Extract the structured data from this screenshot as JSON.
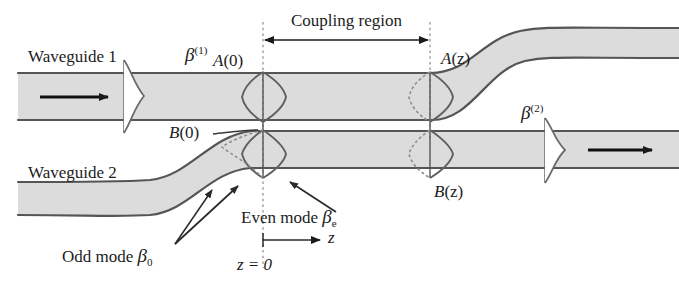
{
  "figure": {
    "type": "directional-coupler-diagram",
    "width": 679,
    "height": 298,
    "background_color": "#ffffff",
    "waveguide_fill": "#dcdcdc",
    "waveguide_stroke": "#555555",
    "mode_curve_color": "#6b6b6b",
    "dashed_line_color": "#9a9a9a",
    "arrow_color": "#1a1a1a"
  },
  "labels": {
    "waveguide1": "Waveguide 1",
    "waveguide2": "Waveguide 2",
    "beta1_symbol": "β",
    "beta1_superscript": "(1)",
    "beta2_symbol": "β",
    "beta2_superscript": "(2)",
    "coupling_region": "Coupling region",
    "amplitude_a0_name": "A",
    "amplitude_a0_arg": "(0)",
    "amplitude_az_name": "A",
    "amplitude_az_arg": "(z)",
    "amplitude_b0_name": "B",
    "amplitude_b0_arg": "(0)",
    "amplitude_bz_name": "B",
    "amplitude_bz_arg": "(z)",
    "even_mode_text": "Even mode ",
    "even_mode_symbol": "β",
    "even_mode_subscript": "e",
    "odd_mode_text": "Odd mode ",
    "odd_mode_symbol": "β",
    "odd_mode_subscript": "0",
    "z_axis": "z",
    "z_origin": "z = 0"
  },
  "geometry": {
    "coupling_region_start_x": 263,
    "coupling_region_end_x": 430,
    "waveguide1_top_y": 73,
    "waveguide1_bottom_y": 120,
    "waveguide2_top_y": 130,
    "waveguide2_bottom_y": 175,
    "z_origin_x": 263
  }
}
